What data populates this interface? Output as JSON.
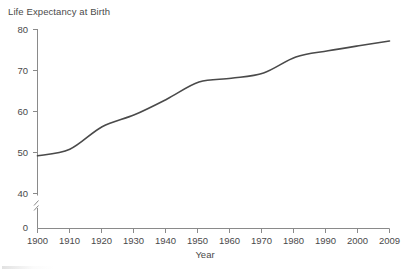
{
  "chart_data": {
    "type": "line",
    "title": "Life Expectancy at Birth",
    "xlabel": "Year",
    "ylabel": "",
    "x": [
      1900,
      1910,
      1920,
      1930,
      1940,
      1950,
      1960,
      1970,
      1980,
      1990,
      2000,
      2009
    ],
    "values": [
      49.2,
      50.8,
      56.3,
      59.2,
      63.0,
      67.2,
      68.1,
      69.4,
      73.3,
      74.8,
      76.1,
      77.2
    ],
    "series": [
      {
        "name": "Life expectancy at birth",
        "values": [
          49.2,
          50.8,
          56.3,
          59.2,
          63.0,
          67.2,
          68.1,
          69.4,
          73.3,
          74.8,
          76.1,
          77.2
        ]
      }
    ],
    "xlim": [
      1900,
      2009
    ],
    "ylim": [
      40,
      80
    ],
    "y_axis_break": true,
    "y_break_note": "Axis broken between 0 and 40",
    "grid": false,
    "legend": false,
    "line_color": "#4a4a4a",
    "xticks": [
      "1900",
      "1910",
      "1920",
      "1930",
      "1940",
      "1950",
      "1960",
      "1970",
      "1980",
      "1990",
      "2000",
      "2009"
    ],
    "yticks": [
      "0",
      "40",
      "50",
      "60",
      "70",
      "80"
    ]
  },
  "axis": {
    "y_labels": [
      {
        "text": "80",
        "value": 80
      },
      {
        "text": "70",
        "value": 70
      },
      {
        "text": "60",
        "value": 60
      },
      {
        "text": "50",
        "value": 50
      },
      {
        "text": "40",
        "value": 40
      },
      {
        "text": "0",
        "value": 0
      }
    ],
    "x_labels": [
      {
        "text": "1900",
        "value": 1900
      },
      {
        "text": "1910",
        "value": 1910
      },
      {
        "text": "1920",
        "value": 1920
      },
      {
        "text": "1930",
        "value": 1930
      },
      {
        "text": "1940",
        "value": 1940
      },
      {
        "text": "1950",
        "value": 1950
      },
      {
        "text": "1960",
        "value": 1960
      },
      {
        "text": "1970",
        "value": 1970
      },
      {
        "text": "1980",
        "value": 1980
      },
      {
        "text": "1990",
        "value": 1990
      },
      {
        "text": "2000",
        "value": 2000
      },
      {
        "text": "2009",
        "value": 2009
      }
    ]
  }
}
